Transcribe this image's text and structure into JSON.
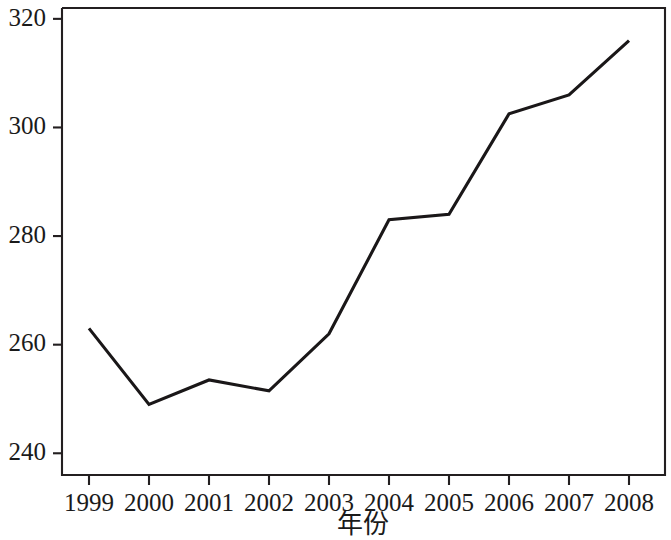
{
  "chart_data": {
    "type": "line",
    "title": "",
    "subtitle": "",
    "xlabel": "年份",
    "ylabel": "",
    "categories": [
      "1999",
      "2000",
      "2001",
      "2002",
      "2003",
      "2004",
      "2005",
      "2006",
      "2007",
      "2008"
    ],
    "x": [
      1999,
      2000,
      2001,
      2002,
      2003,
      2004,
      2005,
      2006,
      2007,
      2008
    ],
    "values": [
      263,
      249,
      253.5,
      251.5,
      262,
      283,
      284,
      302.5,
      306,
      316
    ],
    "series": [
      {
        "name": "",
        "values": [
          263,
          249,
          253.5,
          251.5,
          262,
          283,
          284,
          302.5,
          306,
          316
        ]
      }
    ],
    "ylim": [
      236,
      322
    ],
    "xlim": [
      1998.55,
      2008.6
    ],
    "yticks": [
      240,
      260,
      280,
      300,
      320
    ],
    "ytick_labels": [
      "240",
      "260",
      "280",
      "300",
      "320"
    ],
    "xticks": [
      1999,
      2000,
      2001,
      2002,
      2003,
      2004,
      2005,
      2006,
      2007,
      2008
    ],
    "xtick_labels": [
      "1999",
      "2000",
      "2001",
      "2002",
      "2003",
      "2004",
      "2005",
      "2006",
      "2007",
      "2008"
    ],
    "grid": false,
    "legend": false,
    "legend_position": "none",
    "line_color": "#1a1718",
    "frame_color": "#231f20",
    "background_color": "#ffffff",
    "annotations": []
  }
}
